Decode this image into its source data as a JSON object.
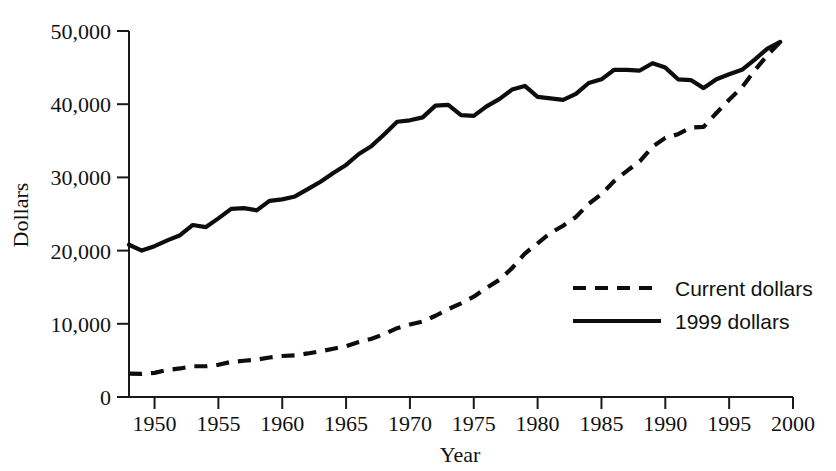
{
  "chart_data": {
    "type": "line",
    "title": "",
    "xlabel": "Year",
    "ylabel": "Dollars",
    "xlim": [
      1948,
      2000
    ],
    "ylim": [
      0,
      50000
    ],
    "grid": false,
    "legend_position": "center-right",
    "x_ticks": [
      1950,
      1955,
      1960,
      1965,
      1970,
      1975,
      1980,
      1985,
      1990,
      1995,
      2000
    ],
    "x_tick_labels": [
      "1950",
      "1955",
      "1960",
      "1965",
      "1970",
      "1975",
      "1980",
      "1985",
      "1990",
      "1995",
      "2000"
    ],
    "y_ticks": [
      0,
      10000,
      20000,
      30000,
      40000,
      50000
    ],
    "y_tick_labels": [
      "0",
      "10,000",
      "20,000",
      "30,000",
      "40,000",
      "50,000"
    ],
    "series": [
      {
        "name": "Current dollars",
        "style": "dashed",
        "color": "#0d0d0d",
        "x": [
          1948,
          1949,
          1950,
          1951,
          1952,
          1953,
          1954,
          1955,
          1956,
          1957,
          1958,
          1959,
          1960,
          1961,
          1962,
          1963,
          1964,
          1965,
          1966,
          1967,
          1968,
          1969,
          1970,
          1971,
          1972,
          1973,
          1974,
          1975,
          1976,
          1977,
          1978,
          1979,
          1980,
          1981,
          1982,
          1983,
          1984,
          1985,
          1986,
          1987,
          1988,
          1989,
          1990,
          1991,
          1992,
          1993,
          1994,
          1995,
          1996,
          1997,
          1998,
          1999
        ],
        "values": [
          3200,
          3150,
          3300,
          3700,
          3900,
          4200,
          4200,
          4400,
          4800,
          4950,
          5100,
          5400,
          5600,
          5700,
          5950,
          6250,
          6600,
          6950,
          7500,
          7950,
          8600,
          9400,
          9900,
          10300,
          11100,
          12000,
          12800,
          13700,
          14900,
          16000,
          17600,
          19600,
          21000,
          22400,
          23400,
          24600,
          26400,
          27700,
          29500,
          30900,
          32200,
          34200,
          35400,
          35900,
          36800,
          36900,
          38800,
          40600,
          42300,
          44600,
          46700,
          48500
        ]
      },
      {
        "name": "1999 dollars",
        "style": "solid",
        "color": "#0d0d0d",
        "x": [
          1948,
          1949,
          1950,
          1951,
          1952,
          1953,
          1954,
          1955,
          1956,
          1957,
          1958,
          1959,
          1960,
          1961,
          1962,
          1963,
          1964,
          1965,
          1966,
          1967,
          1968,
          1969,
          1970,
          1971,
          1972,
          1973,
          1974,
          1975,
          1976,
          1977,
          1978,
          1979,
          1980,
          1981,
          1982,
          1983,
          1984,
          1985,
          1986,
          1987,
          1988,
          1989,
          1990,
          1991,
          1992,
          1993,
          1994,
          1995,
          1996,
          1997,
          1998,
          1999
        ],
        "values": [
          20800,
          20000,
          20600,
          21400,
          22100,
          23500,
          23200,
          24400,
          25700,
          25800,
          25500,
          26800,
          27000,
          27400,
          28400,
          29400,
          30600,
          31700,
          33200,
          34300,
          35900,
          37600,
          37800,
          38200,
          39800,
          39900,
          38500,
          38400,
          39700,
          40700,
          42000,
          42500,
          41000,
          40800,
          40600,
          41400,
          42900,
          43400,
          44700,
          44700,
          44600,
          45600,
          45000,
          43400,
          43300,
          42200,
          43400,
          44100,
          44700,
          46100,
          47600,
          48500
        ]
      }
    ],
    "legend_entries": [
      {
        "label": "Current dollars",
        "style": "dashed"
      },
      {
        "label": "1999 dollars",
        "style": "solid"
      }
    ]
  }
}
